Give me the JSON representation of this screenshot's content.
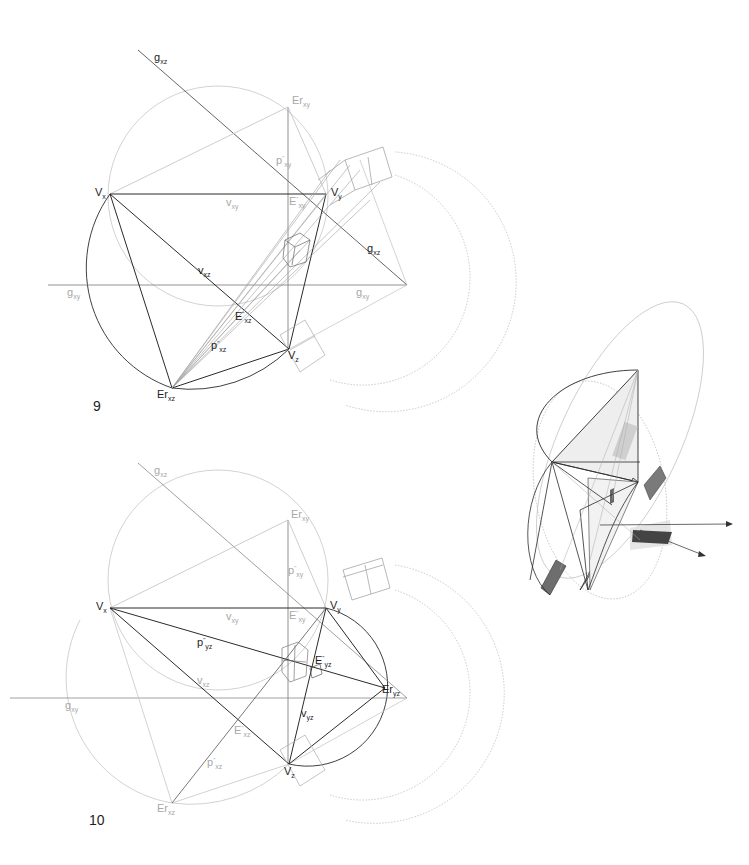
{
  "figures": [
    {
      "number": "9",
      "labels": {
        "g_xz_top": {
          "base": "g",
          "sub": "xz"
        },
        "Er_xy": {
          "base": "Er",
          "sub": "xy"
        },
        "p_xy": {
          "base": "p",
          "sup": "\"",
          "sub": "xy"
        },
        "V_x": {
          "base": "V",
          "sub": "x"
        },
        "v_xy": {
          "base": "v",
          "sub": "xy"
        },
        "E_xy": {
          "base": "E",
          "sup": "\"",
          "sub": "xy"
        },
        "V_y": {
          "base": "V",
          "sub": "y"
        },
        "g_xz_right": {
          "base": "g",
          "sub": "xz"
        },
        "v_xz": {
          "base": "v",
          "sub": "xz"
        },
        "g_xy_left": {
          "base": "g",
          "sub": "xy"
        },
        "g_xy_right": {
          "base": "g",
          "sub": "xy"
        },
        "E_xz": {
          "base": "E",
          "sup": "\"",
          "sub": "xz"
        },
        "p_xz": {
          "base": "p",
          "sup": "\"",
          "sub": "xz"
        },
        "V_z": {
          "base": "V",
          "sub": "z"
        },
        "Er_xz": {
          "base": "Er",
          "sub": "xz"
        }
      }
    },
    {
      "number": "10",
      "labels": {
        "g_xz_top": {
          "base": "g",
          "sub": "xz"
        },
        "Er_xy": {
          "base": "Er",
          "sub": "xy"
        },
        "p_xy": {
          "base": "p",
          "sup": "\"",
          "sub": "xy"
        },
        "V_x": {
          "base": "V",
          "sub": "x"
        },
        "v_xy": {
          "base": "v",
          "sub": "xy"
        },
        "E_xy": {
          "base": "E",
          "sup": "\"",
          "sub": "xy"
        },
        "V_y": {
          "base": "V",
          "sub": "y"
        },
        "p_yz": {
          "base": "p",
          "sup": "\"",
          "sub": "yz"
        },
        "E_yz": {
          "base": "E",
          "sup": "\"",
          "sub": "yz"
        },
        "v_xz": {
          "base": "v",
          "sub": "xz"
        },
        "Er_yz": {
          "base": "Er",
          "sub": "yz"
        },
        "g_xy_left": {
          "base": "g",
          "sub": "xy"
        },
        "v_yz": {
          "base": "v",
          "sub": "yz"
        },
        "E_xz": {
          "base": "E",
          "sup": "\"",
          "sub": "xz"
        },
        "p_xz": {
          "base": "p",
          "sup": "\"",
          "sub": "xz"
        },
        "V_z": {
          "base": "V",
          "sub": "z"
        },
        "Er_xz": {
          "base": "Er",
          "sub": "xz"
        }
      }
    }
  ],
  "axonometric_view": {
    "description": "3D isometric sketch of the vanishing-point triangle with rotated planes and box"
  },
  "colors": {
    "dark_line": "#2a2a2a",
    "light_line": "#b8b8b8",
    "shade_dark": "#555555",
    "shade_mid": "#8a8a8a",
    "shade_light": "#d6d6d6"
  }
}
